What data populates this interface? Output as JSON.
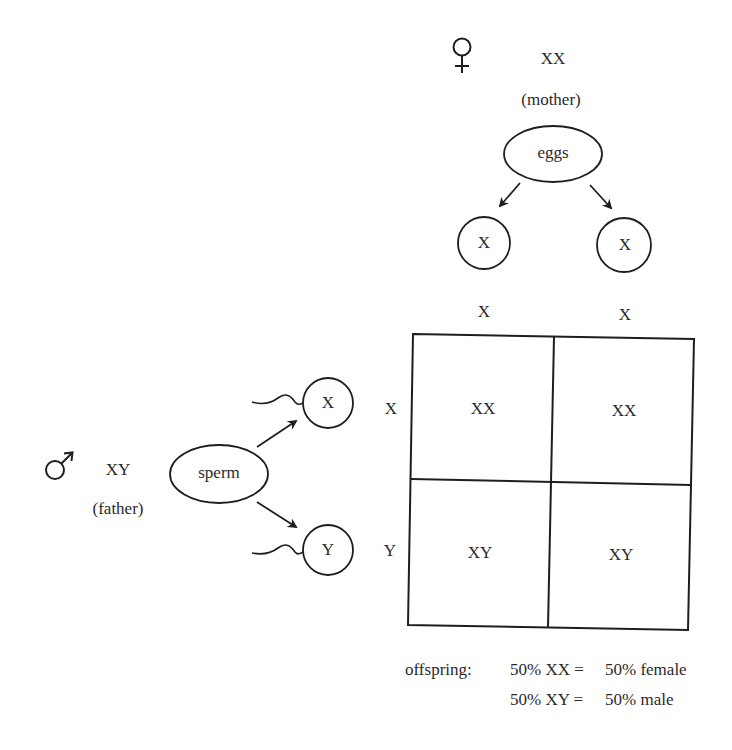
{
  "mother": {
    "symbol": "female-symbol",
    "genotype": "XX",
    "label": "(mother)",
    "gamete_source": "eggs",
    "gametes": [
      "X",
      "X"
    ]
  },
  "father": {
    "symbol": "male-symbol",
    "genotype": "XY",
    "label": "(father)",
    "gamete_source": "sperm",
    "gametes": [
      "X",
      "Y"
    ]
  },
  "punnett": {
    "column_headers": [
      "X",
      "X"
    ],
    "row_headers": [
      "X",
      "Y"
    ],
    "cells": [
      [
        "XX",
        "XX"
      ],
      [
        "XY",
        "XY"
      ]
    ]
  },
  "offspring": {
    "label": "offspring:",
    "lines": [
      {
        "genotype": "50% XX =",
        "phenotype": "50% female"
      },
      {
        "genotype": "50% XY =",
        "phenotype": "50% male"
      }
    ]
  },
  "colors": {
    "ink": "#2a2a2a",
    "background": "#ffffff"
  }
}
